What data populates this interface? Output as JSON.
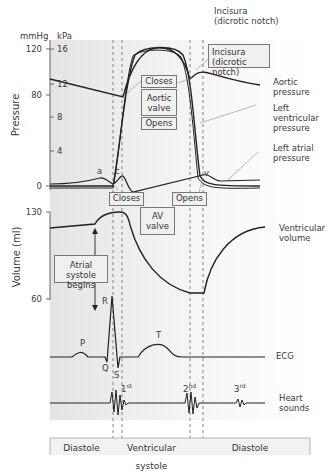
{
  "axes": {
    "pressure_label": "Pressure",
    "volume_label": "Volume (ml)",
    "unit_mmhg": "mmHg",
    "unit_kpa": "kPa",
    "mmhg_ticks": [
      "120",
      "80",
      "0"
    ],
    "kpa_ticks": [
      "16",
      "12",
      "8",
      "4"
    ],
    "volume_ticks": [
      "130",
      "60"
    ]
  },
  "annotations": {
    "incisura_top": "Incisura",
    "incisura_top_sub": "(dicrotic notch)",
    "incisura_box": "Incisura",
    "incisura_box_sub": "(dicrotic notch)",
    "aortic_closes": "Closes",
    "aortic_valve_1": "Aortic",
    "aortic_valve_2": "valve",
    "aortic_opens": "Opens",
    "av_closes": "Closes",
    "av_valve_1": "AV",
    "av_valve_2": "valve",
    "av_opens": "Opens",
    "atrial_systole_1": "Atrial systole",
    "atrial_systole_2": "begins",
    "wave_a": "a",
    "wave_c": "c",
    "wave_v": "v",
    "ecg_p": "P",
    "ecg_q": "Q",
    "ecg_r": "R",
    "ecg_s": "S",
    "ecg_t": "T",
    "sound_1": "1",
    "sound_1_sup": "st",
    "sound_2": "2",
    "sound_2_sup": "nd",
    "sound_3": "3",
    "sound_3_sup": "rd"
  },
  "curve_labels": {
    "aortic_1": "Aortic",
    "aortic_2": "pressure",
    "lv_1": "Left",
    "lv_2": "ventricular",
    "lv_3": "pressure",
    "la_1": "Left atrial",
    "la_2": "pressure",
    "vol_1": "Ventricular",
    "vol_2": "volume",
    "ecg": "ECG",
    "hs_1": "Heart",
    "hs_2": "sounds"
  },
  "phases": [
    "Diastole",
    "Ventricular systole",
    "Diastole"
  ],
  "colors": {
    "panel_bg": "#ececec",
    "curve": "#222222",
    "box_bg": "#f0f0f0",
    "leader": "#888888"
  }
}
